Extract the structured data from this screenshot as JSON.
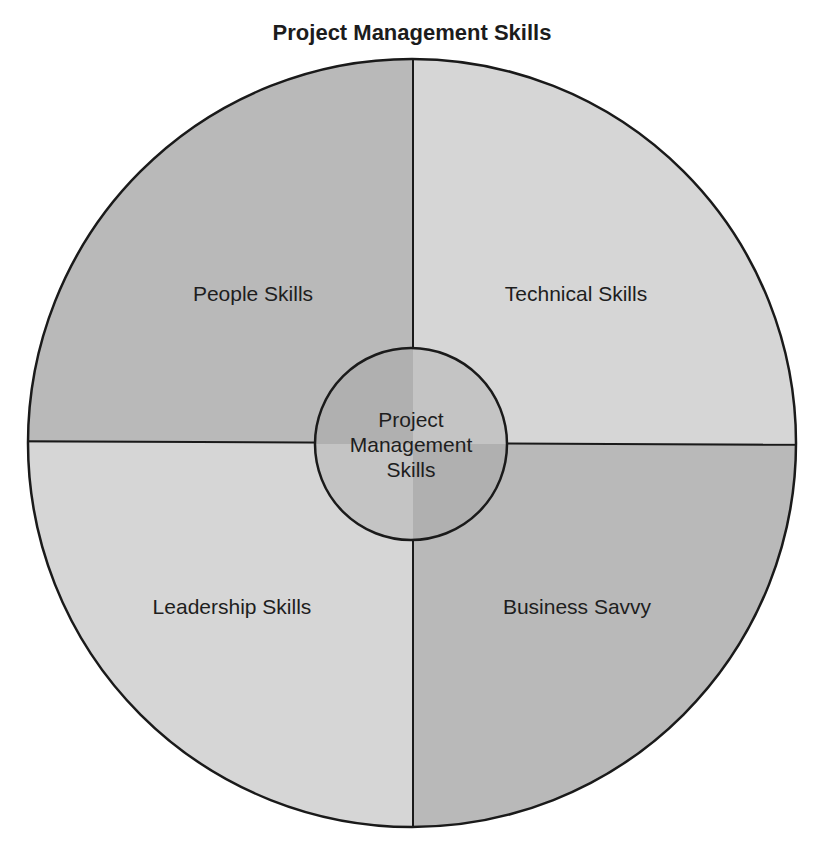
{
  "title": "Project Management Skills",
  "diagram": {
    "center": {
      "lines": [
        "Project",
        "Management",
        "Skills"
      ]
    },
    "quadrants": [
      {
        "position": "top-left",
        "label": "People Skills",
        "color": "#b9b9b9"
      },
      {
        "position": "top-right",
        "label": "Technical Skills",
        "color": "#d6d6d6"
      },
      {
        "position": "bottom-left",
        "label": "Leadership Skills",
        "color": "#d6d6d6"
      },
      {
        "position": "bottom-right",
        "label": "Business Savvy",
        "color": "#b9b9b9"
      }
    ],
    "stroke_color": "#1a1a1a"
  }
}
